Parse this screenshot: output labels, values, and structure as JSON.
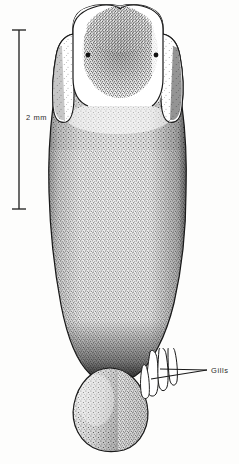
{
  "figure": {
    "domain": "scientific-illustration",
    "subject_name": "pteropod-dorsal-view",
    "background_color": "#fdfdfc",
    "ink_color": "#1a1a1a",
    "width": 239,
    "height": 464
  },
  "scale_bar": {
    "label": "2 mm",
    "orientation": "vertical",
    "x": 19,
    "y_top": 30,
    "y_bottom": 209,
    "cap_half_width": 7,
    "color": "#2b2b2b"
  },
  "annotations": [
    {
      "id": "gills",
      "label": "Gills",
      "text_x": 211,
      "text_y": 366,
      "leader_lines": [
        {
          "x1": 207,
          "y1": 370,
          "x2": 160,
          "y2": 369
        },
        {
          "x1": 207,
          "y1": 370,
          "x2": 151,
          "y2": 379
        }
      ]
    }
  ],
  "anatomy": {
    "head": {
      "name": "head-lobe",
      "top_y": 6,
      "notch_x": 120,
      "left_x": 73,
      "right_x": 168
    },
    "eyes": [
      {
        "name": "left-eyespot",
        "cx": 88,
        "cy": 55,
        "r": 2.3
      },
      {
        "name": "right-eyespot",
        "cx": 156,
        "cy": 55,
        "r": 2.3
      }
    ],
    "wings": [
      {
        "name": "left-parapodium",
        "top_y": 36,
        "bottom_y": 110,
        "outer_x": 56
      },
      {
        "name": "right-parapodium",
        "top_y": 36,
        "bottom_y": 110,
        "outer_x": 186
      }
    ],
    "body": {
      "name": "visceral-mass",
      "widest_left_x": 50,
      "widest_right_x": 186,
      "widest_y": 215,
      "bottom_y": 380
    },
    "gill_filaments": {
      "name": "gill-filaments",
      "count": 4,
      "x_range": [
        140,
        178
      ],
      "y_range": [
        355,
        398
      ]
    },
    "tail": {
      "name": "foot-tail",
      "top_y": 372,
      "tip_y": 452,
      "left_x": 73,
      "right_x": 147
    }
  }
}
